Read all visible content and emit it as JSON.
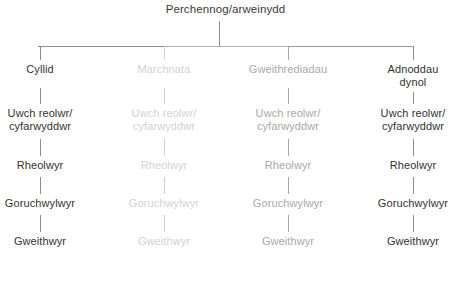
{
  "chart_data": {
    "type": "diagram",
    "title": "Perchennog/arweinydd",
    "subtype": "organisational-hierarchy-tree",
    "language": "cy",
    "levels": 6,
    "branches": 4,
    "root": {
      "label": "Perchennog/arweinydd",
      "tone": "dark"
    },
    "row_labels": [
      "Department",
      "Uwch reolwr/cyfarwyddwr",
      "Rheolwyr",
      "Goruchwylwyr",
      "Gweithwyr"
    ],
    "columns": [
      {
        "department": "Cyllid",
        "tone": "dark",
        "color": "#333333",
        "line_color": "#8d8d8d",
        "roles": [
          "Uwch reolwr/",
          "cyfarwyddwr",
          "Rheolwyr",
          "Goruchwylwyr",
          "Gweithwyr"
        ]
      },
      {
        "department": "Marchnata",
        "tone": "faint",
        "color": "#d2d2d2",
        "line_color": "#cfcfcf",
        "roles": [
          "Uwch reolwr/",
          "cyfarwyddwr",
          "Rheolwyr",
          "Goruchwylwyr",
          "Gweithwyr"
        ]
      },
      {
        "department": "Gweithrediadau",
        "tone": "mid",
        "color": "#a9a9a9",
        "line_color": "#a6a6a6",
        "roles": [
          "Uwch reolwr/",
          "cyfarwyddwr",
          "Rheolwyr",
          "Goruchwylwyr",
          "Gweithwyr"
        ]
      },
      {
        "department": "Adnoddau dynol",
        "department_line1": "Adnoddau",
        "department_line2": "dynol",
        "tone": "dark",
        "color": "#333333",
        "line_color": "#8d8d8d",
        "roles": [
          "Uwch reolwr/",
          "cyfarwyddwr",
          "Rheolwyr",
          "Goruchwylwyr",
          "Gweithwyr"
        ]
      }
    ],
    "background": "#ffffff"
  }
}
